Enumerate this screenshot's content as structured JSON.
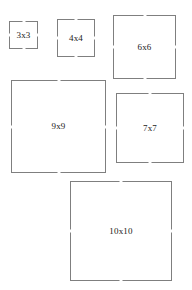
{
  "page": {
    "background_color": "#ffffff",
    "width": 192,
    "height": 290
  },
  "style": {
    "border_color": "#7f7f7f",
    "fill_color": "#ffffff",
    "text_color": "#1a1a1a"
  },
  "squares": [
    {
      "id": "square-3x3",
      "label": "3x3",
      "size_label": "3x3",
      "x": 9,
      "y": 21,
      "width": 29,
      "height": 28,
      "font_size": 9
    },
    {
      "id": "square-4x4",
      "label": "4x4",
      "size_label": "4x4",
      "x": 57,
      "y": 19,
      "width": 38,
      "height": 38,
      "font_size": 9
    },
    {
      "id": "square-6x6",
      "label": "6x6",
      "size_label": "6x6",
      "x": 113,
      "y": 15,
      "width": 63,
      "height": 64,
      "font_size": 9
    },
    {
      "id": "square-9x9",
      "label": "9x9",
      "size_label": "9x9",
      "x": 11,
      "y": 80,
      "width": 95,
      "height": 93,
      "font_size": 9
    },
    {
      "id": "square-7x7",
      "label": "7x7",
      "size_label": "7x7",
      "x": 116,
      "y": 93,
      "width": 68,
      "height": 70,
      "font_size": 9
    },
    {
      "id": "square-10x10",
      "label": "10x10",
      "size_label": "10x10",
      "x": 70,
      "y": 181,
      "width": 102,
      "height": 100,
      "font_size": 9
    }
  ]
}
